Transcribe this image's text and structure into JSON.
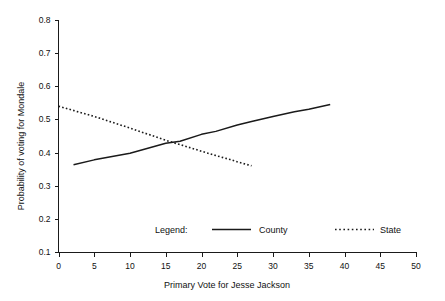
{
  "figure": {
    "background_color": "#ffffff",
    "ink_color": "#1a1a1a",
    "top_caption_fragment": ""
  },
  "axes": {
    "x_title": "Primary Vote for Jesse Jackson",
    "y_title": "Probability of voting for Mondale",
    "x_ticks": [
      "0",
      "5",
      "10",
      "15",
      "20",
      "25",
      "30",
      "35",
      "40",
      "45",
      "50"
    ],
    "y_ticks": [
      "0.1",
      "0.2",
      "0.3",
      "0.4",
      "0.5",
      "0.6",
      "0.7",
      "0.8"
    ]
  },
  "legend": {
    "title": "Legend:",
    "entries": [
      {
        "label": "County",
        "style": "solid"
      },
      {
        "label": "State",
        "style": "dotted"
      }
    ]
  },
  "chart_data": {
    "type": "line",
    "title": "",
    "xlabel": "Primary Vote for Jesse Jackson",
    "ylabel": "Probability of voting for Mondale",
    "xlim": [
      0,
      50
    ],
    "ylim": [
      0.1,
      0.8
    ],
    "xticks": [
      0,
      5,
      10,
      15,
      20,
      25,
      30,
      35,
      40,
      45,
      50
    ],
    "yticks": [
      0.1,
      0.2,
      0.3,
      0.4,
      0.5,
      0.6,
      0.7,
      0.8
    ],
    "grid": false,
    "legend_position": "inside-bottom",
    "series": [
      {
        "name": "County",
        "style": "solid",
        "x": [
          2.1,
          5.0,
          10.0,
          15.0,
          17.0,
          20.0,
          22.0,
          25.0,
          27.0,
          30.0,
          33.0,
          35.0,
          38.0
        ],
        "y": [
          0.363,
          0.378,
          0.398,
          0.428,
          0.434,
          0.455,
          0.464,
          0.483,
          0.494,
          0.509,
          0.523,
          0.531,
          0.545
        ]
      },
      {
        "name": "State",
        "style": "dotted",
        "x": [
          0.0,
          5.0,
          10.0,
          15.0,
          17.0,
          20.0,
          22.0,
          24.0,
          25.0,
          27.0
        ],
        "y": [
          0.54,
          0.509,
          0.474,
          0.437,
          0.424,
          0.404,
          0.391,
          0.379,
          0.372,
          0.36
        ]
      }
    ]
  }
}
